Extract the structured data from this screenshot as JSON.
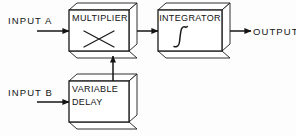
{
  "diagram": {
    "background_color": "#fdfdfd",
    "line_color": "#1a1a1a",
    "face_color": "#ffffff",
    "shade_color": "#efefef",
    "inputs": [
      {
        "id": "input-a",
        "label": "INPUT  A"
      },
      {
        "id": "input-b",
        "label": "INPUT  B"
      }
    ],
    "outputs": [
      {
        "id": "output",
        "label": "OUTPUT"
      }
    ],
    "blocks": [
      {
        "id": "multiplier",
        "label": "MULTIPLIER",
        "symbol": "×",
        "symbol_name": "multiply-symbol",
        "x": 69,
        "y": 10,
        "w": 60,
        "h": 41,
        "depth": 8
      },
      {
        "id": "integrator",
        "label": "INTEGRATOR",
        "symbol": "∫",
        "symbol_name": "integral-symbol",
        "x": 158,
        "y": 10,
        "w": 64,
        "h": 41,
        "depth": 8
      },
      {
        "id": "variable-delay",
        "label_line1": "VARIABLE",
        "label_line2": "DELAY",
        "x": 69,
        "y": 81,
        "w": 60,
        "h": 41,
        "depth": 8
      }
    ],
    "connections": [
      {
        "id": "conn-input-a-multiplier",
        "from": "input-a",
        "to": "multiplier"
      },
      {
        "id": "conn-input-b-delay",
        "from": "input-b",
        "to": "variable-delay"
      },
      {
        "id": "conn-delay-multiplier",
        "from": "variable-delay",
        "to": "multiplier"
      },
      {
        "id": "conn-multiplier-integrator",
        "from": "multiplier",
        "to": "integrator"
      },
      {
        "id": "conn-integrator-output",
        "from": "integrator",
        "to": "output"
      }
    ]
  }
}
